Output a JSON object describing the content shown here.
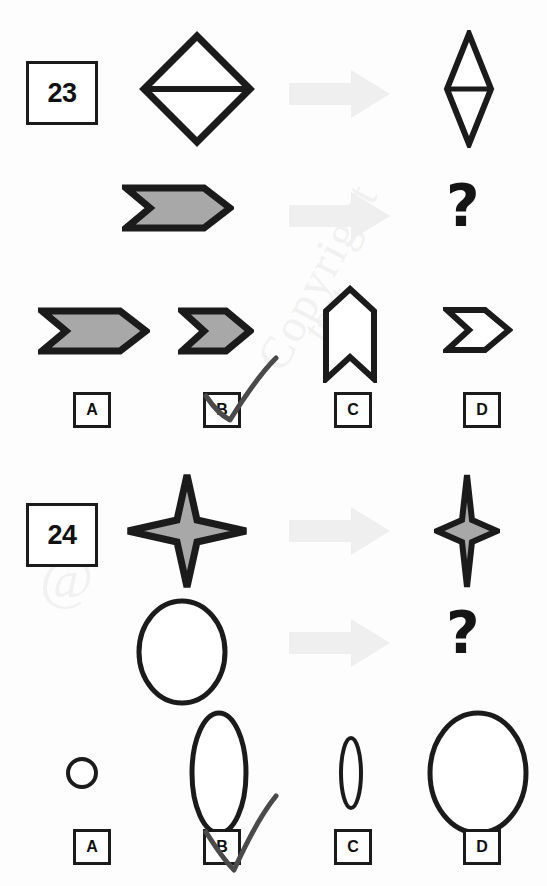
{
  "document": {
    "kind": "visual-analogy-test",
    "background_color": "#fdfdfd",
    "ink_color": "#1b1b1b",
    "fill_gray": "#a8a8a8",
    "arrow_gray": "#efefef",
    "check_color": "#4a4a4a"
  },
  "watermarks": [
    {
      "text": "Copyright"
    },
    {
      "text": "@"
    },
    {
      "text": "test"
    }
  ],
  "puzzles": [
    {
      "number": "23",
      "prompt_row": {
        "source_shape": "diamond-with-horizontal-line",
        "arrow": "right-arrow",
        "result_shape": "narrow-diamond-with-horizontal-line"
      },
      "question_row": {
        "source_shape": "gray-chevron-wide",
        "arrow": "right-arrow",
        "result_shape": "question-mark",
        "question_mark": "?"
      },
      "options": [
        {
          "letter": "A",
          "shape": "gray-chevron-wide",
          "selected": false
        },
        {
          "letter": "B",
          "shape": "gray-chevron-narrow",
          "selected": true
        },
        {
          "letter": "C",
          "shape": "white-vertical-banner",
          "selected": false
        },
        {
          "letter": "D",
          "shape": "white-chevron-narrow",
          "selected": false
        }
      ]
    },
    {
      "number": "24",
      "prompt_row": {
        "source_shape": "gray-four-point-star",
        "arrow": "right-arrow",
        "result_shape": "narrow-gray-four-point-star"
      },
      "question_row": {
        "source_shape": "ellipse-tall",
        "arrow": "right-arrow",
        "result_shape": "question-mark",
        "question_mark": "?"
      },
      "options": [
        {
          "letter": "A",
          "shape": "small-circle",
          "selected": false
        },
        {
          "letter": "B",
          "shape": "tall-narrow-ellipse",
          "selected": true
        },
        {
          "letter": "C",
          "shape": "tiny-narrow-ellipse",
          "selected": false
        },
        {
          "letter": "D",
          "shape": "large-ellipse",
          "selected": false
        }
      ]
    }
  ]
}
